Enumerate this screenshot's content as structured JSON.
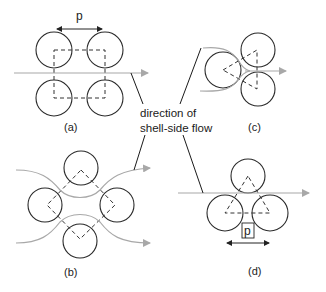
{
  "diagram": {
    "center_label": {
      "line1": "direction of",
      "line2": "shell-side flow"
    },
    "panels": [
      {
        "id": "a",
        "label": "(a)",
        "layout": "square in-line",
        "pitch_label": "p"
      },
      {
        "id": "b",
        "label": "(b)",
        "layout": "rotated square (diamond)"
      },
      {
        "id": "c",
        "label": "(c)",
        "layout": "rotated triangular"
      },
      {
        "id": "d",
        "label": "(d)",
        "layout": "triangular",
        "pitch_label": "p"
      }
    ],
    "colors": {
      "tube_outline": "#2a2a2a",
      "flow_line": "#a8a8a8",
      "dashed_pitch": "#333333",
      "leader_line": "#1a1a1a"
    }
  }
}
